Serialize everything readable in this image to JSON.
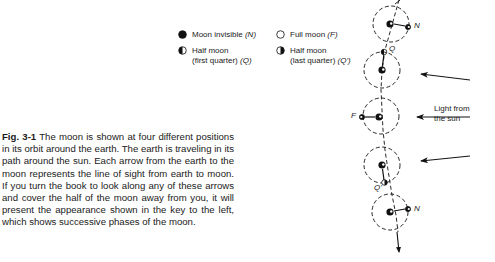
{
  "legend": {
    "items": [
      {
        "symbol": "moon-new",
        "label": "Moon invisible",
        "code": "(N)"
      },
      {
        "symbol": "moon-full",
        "label": "Full moon",
        "code": "(F)"
      },
      {
        "symbol": "moon-first-quarter",
        "label_line1": "Half moon",
        "label_line2": "(first quarter)",
        "code": "(Q)"
      },
      {
        "symbol": "moon-last-quarter",
        "label_line1": "Half moon",
        "label_line2": "(last quarter)",
        "code": "(Q')"
      }
    ]
  },
  "diagram": {
    "labels": {
      "n_top": "N",
      "q_top": "Q",
      "f_mid": "F",
      "q_bottom": "Q'",
      "n_bottom": "N"
    },
    "sun_label_line1": "Light from",
    "sun_label_line2": "the sun"
  },
  "caption": {
    "figure_number": "Fig. 3-1",
    "text": "The moon is shown at four different positions in its orbit around the earth. The earth is traveling in its path around the sun. Each arrow from the earth to the moon represents the line of sight from earth to moon. If you turn the book to look along any of these arrows and cover the half of the moon away from you, it will present the appearance shown in the key to the left, which shows successive phases of the moon."
  }
}
